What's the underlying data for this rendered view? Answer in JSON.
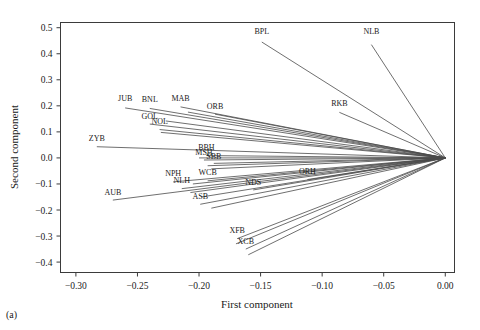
{
  "caption": "(a)",
  "chart_data": {
    "type": "scatter",
    "title": "",
    "xlabel": "First component",
    "ylabel": "Second component",
    "xlim": [
      -0.3125,
      0.0075
    ],
    "ylim": [
      -0.44,
      0.52
    ],
    "grid": false,
    "legend": "none",
    "xticks": [
      -0.3,
      -0.25,
      -0.2,
      -0.15,
      -0.1,
      -0.05,
      0.0
    ],
    "xticklabels": [
      "−0.30",
      "−0.25",
      "−0.20",
      "−0.15",
      "−0.10",
      "−0.05",
      "0.00"
    ],
    "yticks": [
      0.5,
      0.4,
      0.3,
      0.2,
      0.1,
      0.0,
      -0.1,
      -0.2,
      -0.3,
      -0.4
    ],
    "yticklabels": [
      "0.5",
      "0.4",
      "0.3",
      "0.2",
      "0.1",
      "0.0",
      "−0.1",
      "−0.2",
      "−0.3",
      "−0.4"
    ],
    "origin": [
      0.0,
      0.0
    ],
    "points": [
      {
        "label": "BPL",
        "x": -0.149,
        "y": 0.445,
        "lx": -0.149,
        "ly": 0.477
      },
      {
        "label": "NLB",
        "x": -0.06,
        "y": 0.435,
        "lx": -0.06,
        "ly": 0.476
      },
      {
        "label": "RKB",
        "x": -0.086,
        "y": 0.175,
        "lx": -0.086,
        "ly": 0.2
      },
      {
        "label": "JUB",
        "x": -0.26,
        "y": 0.192,
        "lx": -0.26,
        "ly": 0.217
      },
      {
        "label": "BNL",
        "x": -0.24,
        "y": 0.19,
        "lx": -0.24,
        "ly": 0.215
      },
      {
        "label": "MAB",
        "x": -0.215,
        "y": 0.196,
        "lx": -0.215,
        "ly": 0.218
      },
      {
        "label": "ORB",
        "x": -0.187,
        "y": 0.168,
        "lx": -0.187,
        "ly": 0.189
      },
      {
        "label": "GOL",
        "x": -0.24,
        "y": 0.13,
        "lx": -0.24,
        "ly": 0.15
      },
      {
        "label": "NOL",
        "x": -0.232,
        "y": 0.109,
        "lx": -0.232,
        "ly": 0.129
      },
      {
        "label": "ZYB",
        "x": -0.283,
        "y": 0.043,
        "lx": -0.283,
        "ly": 0.066
      },
      {
        "label": "BBH",
        "x": -0.194,
        "y": 0.009,
        "lx": -0.194,
        "ly": 0.03
      },
      {
        "label": "MSH",
        "x": -0.196,
        "y": -0.008,
        "lx": -0.196,
        "ly": 0.012
      },
      {
        "label": "SBB",
        "x": -0.188,
        "y": -0.021,
        "lx": -0.188,
        "ly": -0.003
      },
      {
        "label": "ORH",
        "x": -0.112,
        "y": -0.083,
        "lx": -0.112,
        "ly": -0.062
      },
      {
        "label": "WCB",
        "x": -0.193,
        "y": -0.088,
        "lx": -0.193,
        "ly": -0.067
      },
      {
        "label": "NPH",
        "x": -0.221,
        "y": -0.092,
        "lx": -0.221,
        "ly": -0.07
      },
      {
        "label": "NLH",
        "x": -0.214,
        "y": -0.118,
        "lx": -0.214,
        "ly": -0.097
      },
      {
        "label": "NDS",
        "x": -0.156,
        "y": -0.123,
        "lx": -0.156,
        "ly": -0.103
      },
      {
        "label": "AUB",
        "x": -0.27,
        "y": -0.162,
        "lx": -0.27,
        "ly": -0.142
      },
      {
        "label": "ASB",
        "x": -0.199,
        "y": -0.178,
        "lx": -0.199,
        "ly": -0.157
      },
      {
        "label": "XFB",
        "x": -0.169,
        "y": -0.31,
        "lx": -0.169,
        "ly": -0.29
      },
      {
        "label": "XCB",
        "x": -0.162,
        "y": -0.35,
        "lx": -0.162,
        "ly": -0.33
      }
    ],
    "extra_rays": [
      {
        "x": -0.209,
        "y": 0.176
      },
      {
        "x": -0.227,
        "y": 0.142
      },
      {
        "x": -0.231,
        "y": 0.098
      },
      {
        "x": -0.2,
        "y": 0.0
      },
      {
        "x": -0.193,
        "y": -0.03
      },
      {
        "x": -0.19,
        "y": -0.042
      },
      {
        "x": -0.205,
        "y": -0.1
      },
      {
        "x": -0.207,
        "y": -0.133
      },
      {
        "x": -0.198,
        "y": -0.15
      },
      {
        "x": -0.19,
        "y": -0.193
      },
      {
        "x": -0.17,
        "y": -0.33
      },
      {
        "x": -0.16,
        "y": -0.372
      }
    ]
  }
}
